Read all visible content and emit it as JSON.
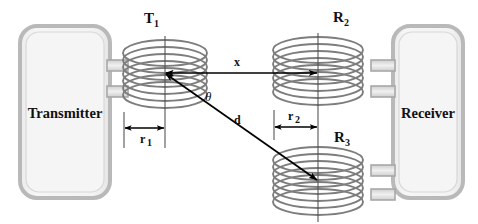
{
  "figure": {
    "type": "schematic-diagram",
    "background_color": "#ffffff"
  },
  "blocks": {
    "transmitter": {
      "label": "Transmitter",
      "fill_color": "#f2f2f2",
      "border_color": "#b5b5b5"
    },
    "receiver": {
      "label": "Receiver",
      "fill_color": "#f2f2f2",
      "border_color": "#b5b5b5"
    }
  },
  "coils": [
    {
      "id": "T1",
      "label": "T",
      "subscript": "1",
      "role": "transmitter-coil",
      "turns": 7,
      "color": "#808080"
    },
    {
      "id": "R2",
      "label": "R",
      "subscript": "2",
      "role": "receiver-coil-upper",
      "turns": 7,
      "color": "#808080"
    },
    {
      "id": "R3",
      "label": "R",
      "subscript": "3",
      "role": "receiver-coil-lower",
      "turns": 7,
      "color": "#808080"
    }
  ],
  "dimensions": [
    {
      "id": "x",
      "label": "x",
      "subscript": "",
      "kind": "double-arrow-horizontal",
      "meaning": "axial-distance-T1-to-R2"
    },
    {
      "id": "d",
      "label": "d",
      "subscript": "",
      "kind": "double-arrow-diagonal",
      "meaning": "distance-T1-to-R3"
    },
    {
      "id": "theta",
      "label": "θ",
      "subscript": "",
      "kind": "angle",
      "meaning": "angle-between-x-and-d"
    },
    {
      "id": "r1",
      "label": "r",
      "subscript": "1",
      "kind": "double-arrow-horizontal",
      "meaning": "radius-of-T1-coil"
    },
    {
      "id": "r2",
      "label": "r",
      "subscript": "2",
      "kind": "double-arrow-horizontal",
      "meaning": "radius-of-R2-coil"
    }
  ],
  "colors": {
    "line": "#000000",
    "coil": "#808080",
    "coil_dark": "#6e6e6e",
    "box_fill": "#f2f2f2",
    "box_border": "#b5b5b5",
    "centerline": "#4a4a4a"
  }
}
